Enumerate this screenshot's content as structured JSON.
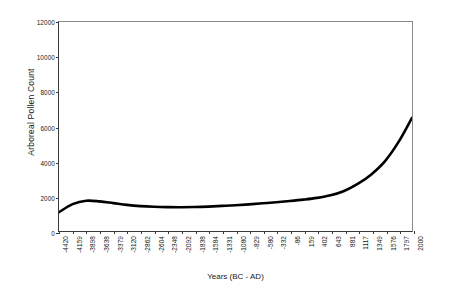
{
  "chart_data": {
    "type": "line",
    "title": "",
    "xlabel": "Years (BC - AD)",
    "ylabel": "Arboreal Pollen Count",
    "grid": false,
    "legend": "none",
    "ylim": [
      0,
      12000
    ],
    "ytick_labels": [
      "0",
      "2000",
      "4000",
      "6000",
      "8000",
      "10000",
      "12000"
    ],
    "ytick_values": [
      0,
      2000,
      4000,
      6000,
      8000,
      10000,
      12000
    ],
    "categories": [
      "-4420",
      "-4159",
      "-3898",
      "-3638",
      "-3379",
      "-3120",
      "-2862",
      "-2604",
      "-2348",
      "-2092",
      "-1838",
      "-1584",
      "-1331",
      "-1080",
      "-829",
      "-580",
      "-332",
      "-86",
      "159",
      "402",
      "643",
      "881",
      "1117",
      "1349",
      "1576",
      "1797",
      "2000"
    ],
    "x_values": [
      -4420,
      -4159,
      -3898,
      -3638,
      -3379,
      -3120,
      -2862,
      -2604,
      -2348,
      -2092,
      -1838,
      -1584,
      -1331,
      -1080,
      -829,
      -580,
      -332,
      -86,
      159,
      402,
      643,
      881,
      1117,
      1349,
      1576,
      1797,
      2000
    ],
    "values": [
      1080,
      1540,
      1740,
      1700,
      1600,
      1500,
      1430,
      1390,
      1370,
      1365,
      1375,
      1400,
      1440,
      1480,
      1530,
      1590,
      1650,
      1720,
      1800,
      1900,
      2050,
      2300,
      2700,
      3250,
      4000,
      5100,
      6500
    ],
    "series_name": "Arboreal Pollen Count",
    "line_color": "#000000",
    "line_width": 2.6,
    "axis_color": "#3a3a3a"
  },
  "caption": {
    "text": ""
  }
}
